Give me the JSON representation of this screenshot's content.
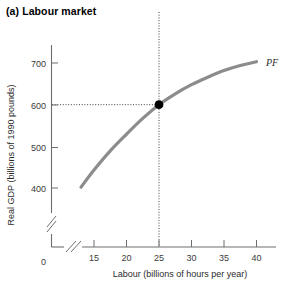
{
  "panel": {
    "label": "(a) Labour market"
  },
  "chart_data": {
    "type": "line",
    "title": "(a) Labour market",
    "subtitle": "",
    "xlabel": "Labour (billions of hours per year)",
    "ylabel": "Real GDP (billions of 1990 pounds)",
    "xlim": [
      13,
      42
    ],
    "ylim": [
      380,
      730
    ],
    "xticks": [
      15,
      20,
      25,
      30,
      35,
      40
    ],
    "yticks": [
      400,
      500,
      600,
      700
    ],
    "origin_tick_label": "0",
    "grid": false,
    "axis_break_x": true,
    "axis_break_y": true,
    "legend_position": "inline-right",
    "series": [
      {
        "name": "PF",
        "label": "PF",
        "color": "#8c8c8c",
        "description": "Production function: real GDP rises with labour at a diminishing rate",
        "x": [
          13,
          15,
          17.5,
          20,
          22.5,
          25,
          27.5,
          30,
          32.5,
          35,
          37.5,
          40
        ],
        "y": [
          402,
          443,
          489,
          529,
          567,
          600,
          626,
          648,
          666,
          682,
          694,
          703
        ]
      }
    ],
    "annotations": [
      {
        "name": "equilibrium-point",
        "type": "point",
        "x": 25,
        "y": 600,
        "marker": "filled-circle",
        "color": "#000000",
        "guides": [
          "horizontal-dotted-to-y-axis",
          "vertical-dotted-to-x-axis"
        ]
      }
    ]
  }
}
